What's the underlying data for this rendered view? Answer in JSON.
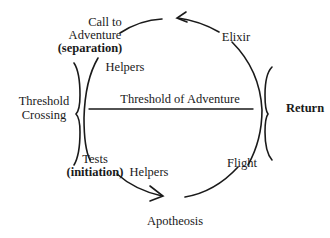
{
  "diagram": {
    "labels": {
      "call_to_adventure_line1": "Call to",
      "call_to_adventure_line2": "Adventure",
      "separation": "(separation)",
      "helpers_top": "Helpers",
      "elixir": "Elixir",
      "threshold_crossing_line1": "Threshold",
      "threshold_crossing_line2": "Crossing",
      "threshold_of_adventure": "Threshold of Adventure",
      "return": "Return",
      "tests": "Tests",
      "initiation": "(initiation)",
      "helpers_bottom": "Helpers",
      "flight": "Flight",
      "apotheosis": "Apotheosis"
    },
    "colors": {
      "ink": "#1a1a1a",
      "background": "#ffffff"
    }
  }
}
